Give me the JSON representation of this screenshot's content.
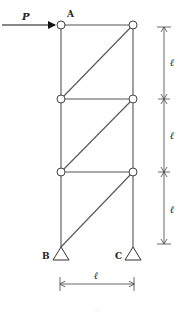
{
  "diagram": {
    "type": "truss",
    "load": {
      "label": "P",
      "applied_at": "A",
      "direction": "right"
    },
    "joints": [
      {
        "id": "A",
        "label": "A"
      },
      {
        "id": "TR",
        "label": ""
      },
      {
        "id": "ML",
        "label": ""
      },
      {
        "id": "MR",
        "label": ""
      },
      {
        "id": "LL",
        "label": ""
      },
      {
        "id": "LR",
        "label": ""
      },
      {
        "id": "B",
        "label": "B"
      },
      {
        "id": "C",
        "label": "C"
      }
    ],
    "supports": [
      {
        "joint": "B",
        "type": "pin"
      },
      {
        "joint": "C",
        "type": "pin"
      }
    ],
    "dimensions": {
      "panel_height_label": "ℓ",
      "width_label": "ℓ",
      "panel_count": 3
    },
    "caption": "..."
  }
}
